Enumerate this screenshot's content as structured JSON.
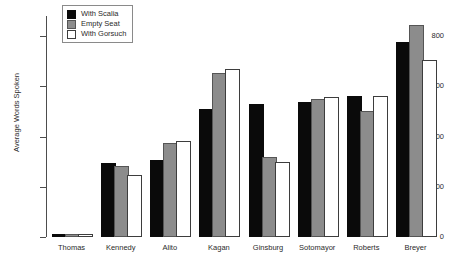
{
  "chart_data": {
    "type": "bar",
    "title": "",
    "xlabel": "",
    "ylabel": "Average Words Spoken",
    "ylim": [
      0,
      880
    ],
    "yticks": [
      0,
      200,
      400,
      600,
      800
    ],
    "ytick_labels": [
      "0",
      "200",
      "400",
      "600",
      "800"
    ],
    "grid": false,
    "legend_position": "top-left-inside",
    "categories": [
      "Thomas",
      "Kennedy",
      "Alito",
      "Kagan",
      "Ginsburg",
      "Sotomayor",
      "Roberts",
      "Breyer"
    ],
    "series": [
      {
        "name": "With Scalia",
        "color": "#0a0a0a",
        "values": [
          2,
          285,
          300,
          500,
          520,
          530,
          553,
          770
        ]
      },
      {
        "name": "Empty Seat",
        "color": "#8c8c8c",
        "values": [
          3,
          275,
          365,
          645,
          310,
          540,
          495,
          835
        ]
      },
      {
        "name": "With Gorsuch",
        "color": "#ffffff",
        "values": [
          1,
          240,
          375,
          660,
          290,
          550,
          553,
          695
        ]
      }
    ]
  },
  "legend": {
    "items": [
      {
        "label": "With Scalia"
      },
      {
        "label": "Empty Seat"
      },
      {
        "label": "With Gorsuch"
      }
    ]
  },
  "axes": {
    "y_title": "Average Words Spoken"
  }
}
